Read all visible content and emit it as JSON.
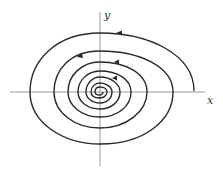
{
  "diagram": {
    "type": "phase-portrait",
    "axes": {
      "x_label": "x",
      "y_label": "y"
    },
    "colors": {
      "curve": "#2a2a2a",
      "axis": "#9a9a9a",
      "background": "#ffffff"
    },
    "arrows": {
      "count": 4,
      "direction": "counterclockwise-inward"
    }
  }
}
